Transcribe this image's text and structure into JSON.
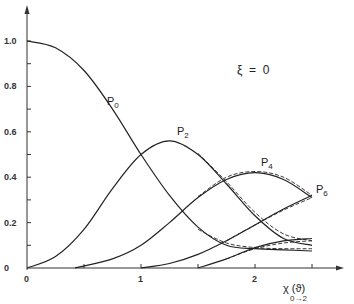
{
  "chart_data": {
    "type": "line",
    "title": "",
    "annotation": "ξ = 0",
    "xlabel": "χ (ϑ)",
    "xlabel_sub": "0→2",
    "ylabel": "",
    "xlim": [
      0,
      2.5
    ],
    "ylim": [
      0,
      1.1
    ],
    "x_ticks": [
      0,
      1,
      2
    ],
    "x_tick_labels": [
      "0",
      "1",
      "2"
    ],
    "y_ticks": [
      0,
      0.2,
      0.4,
      0.6,
      0.8,
      1.0
    ],
    "y_tick_labels": [
      "0",
      "0.2",
      "0.4",
      "0.6",
      "0.8",
      "1.0"
    ],
    "grid": false,
    "legend": "inline curve labels",
    "series": [
      {
        "name": "P0",
        "label_pos": [
          0.7,
          0.72
        ],
        "style": "solid",
        "x": [
          0,
          0.25,
          0.5,
          0.75,
          1.0,
          1.25,
          1.5,
          1.75,
          2.0,
          2.25,
          2.5
        ],
        "values": [
          1.0,
          0.97,
          0.87,
          0.7,
          0.5,
          0.32,
          0.18,
          0.1,
          0.085,
          0.08,
          0.075
        ]
      },
      {
        "name": "P0 (dashed)",
        "style": "dashed",
        "x": [
          1.5,
          1.75,
          2.0,
          2.25,
          2.5
        ],
        "values": [
          0.17,
          0.11,
          0.09,
          0.085,
          0.085
        ]
      },
      {
        "name": "P2",
        "label_pos": [
          1.3,
          0.6
        ],
        "style": "solid",
        "x": [
          0,
          0.25,
          0.5,
          0.75,
          1.0,
          1.25,
          1.5,
          1.75,
          2.0,
          2.25,
          2.5
        ],
        "values": [
          0,
          0.05,
          0.17,
          0.35,
          0.5,
          0.56,
          0.5,
          0.37,
          0.23,
          0.13,
          0.1
        ]
      },
      {
        "name": "P2 (dashed)",
        "style": "dashed",
        "x": [
          1.5,
          1.75,
          2.0,
          2.25,
          2.5
        ],
        "values": [
          0.505,
          0.38,
          0.245,
          0.15,
          0.12
        ]
      },
      {
        "name": "P4",
        "label_pos": [
          2.05,
          0.46
        ],
        "style": "solid",
        "x": [
          0.42,
          0.75,
          1.0,
          1.25,
          1.5,
          1.75,
          2.0,
          2.25,
          2.5
        ],
        "values": [
          0,
          0.04,
          0.1,
          0.2,
          0.31,
          0.39,
          0.42,
          0.39,
          0.31
        ]
      },
      {
        "name": "P4 (dashed)",
        "style": "dashed",
        "x": [
          1.5,
          1.75,
          2.0,
          2.25,
          2.5
        ],
        "values": [
          0.315,
          0.4,
          0.425,
          0.4,
          0.32
        ]
      },
      {
        "name": "P6",
        "label_pos": [
          2.55,
          0.36
        ],
        "style": "solid",
        "x": [
          1.0,
          1.25,
          1.5,
          1.75,
          2.0,
          2.25,
          2.5
        ],
        "values": [
          0,
          0.02,
          0.06,
          0.12,
          0.19,
          0.26,
          0.32
        ]
      },
      {
        "name": "P6 (dashed)",
        "style": "dashed",
        "x": [
          1.75,
          2.0,
          2.25,
          2.5
        ],
        "values": [
          0.12,
          0.19,
          0.255,
          0.31
        ]
      },
      {
        "name": "P8",
        "style": "solid",
        "x": [
          1.5,
          1.75,
          2.0,
          2.25,
          2.5
        ],
        "values": [
          0.0,
          0.04,
          0.09,
          0.12,
          0.13
        ]
      },
      {
        "name": "P8 (dashed)",
        "style": "dashed",
        "x": [
          1.75,
          2.0,
          2.25,
          2.5
        ],
        "values": [
          0.04,
          0.085,
          0.11,
          0.12
        ]
      }
    ]
  },
  "labels": {
    "p0": "P",
    "p0_sub": "0",
    "p2": "P",
    "p2_sub": "2",
    "p4": "P",
    "p4_sub": "4",
    "p6": "P",
    "p6_sub": "6",
    "annotation": "ξ  =  0",
    "xlabel": "χ (ϑ)",
    "xlabel_sub": "0→2",
    "y_ticks": [
      "1.0",
      "0.8",
      "0.6",
      "0.4",
      "0.2",
      "0"
    ],
    "x_ticks": [
      "0",
      "1",
      "2"
    ]
  }
}
